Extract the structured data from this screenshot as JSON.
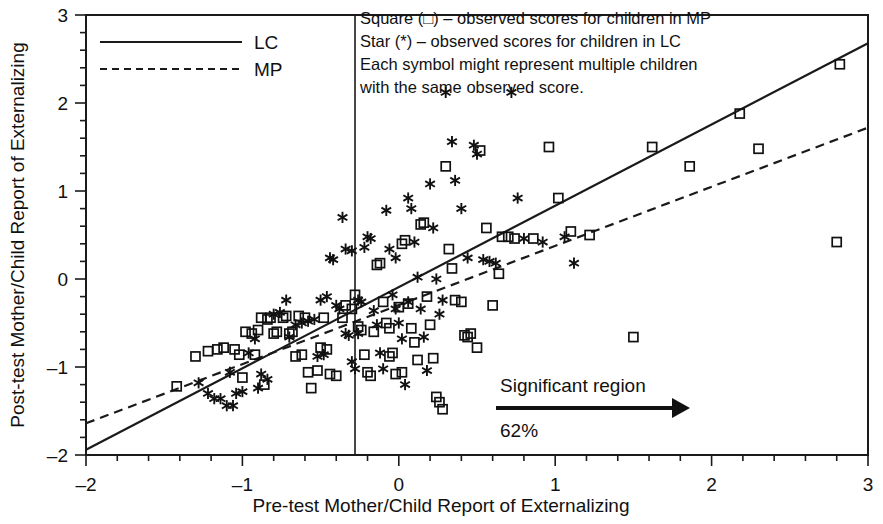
{
  "chart_data": {
    "type": "scatter",
    "title": "",
    "xlabel": "Pre-test Mother/Child Report of Externalizing",
    "ylabel": "Post-test Mother/Child Report of Externalizing",
    "xlim": [
      -2,
      3
    ],
    "ylim": [
      -2,
      3
    ],
    "xticks": [
      -2,
      -1,
      0,
      1,
      2,
      3
    ],
    "xtick_labels": [
      "-2",
      "-1",
      "0",
      "1",
      "2",
      "3"
    ],
    "yticks": [
      -2,
      -1,
      0,
      1,
      2,
      3
    ],
    "ytick_labels": [
      "-2",
      "-1",
      "0",
      "1",
      "2",
      "3"
    ],
    "minor_tick_step": 0.2,
    "grid": false,
    "legend_position": "top-left",
    "legend": [
      {
        "label": "LC",
        "style": "solid",
        "marker": "star"
      },
      {
        "label": "MP",
        "style": "dashed",
        "marker": "square"
      }
    ],
    "annotations": {
      "note_lines": [
        "Square (□) – observed scores for children in MP",
        "Star (*) – observed scores for children in LC",
        "Each symbol might represent multiple children",
        "with the same observed score."
      ],
      "significant_region_label": "Significant region",
      "significant_region_percent": "62%",
      "vertical_reference_line_x": -0.28
    },
    "lines": [
      {
        "name": "LC",
        "style": "solid",
        "x": [
          -2,
          3
        ],
        "y": [
          -1.94,
          2.68
        ]
      },
      {
        "name": "MP",
        "style": "dashed",
        "x": [
          -2,
          3
        ],
        "y": [
          -1.64,
          1.72
        ]
      }
    ],
    "series": [
      {
        "name": "MP",
        "marker": "square",
        "points": [
          [
            -1.42,
            -1.22
          ],
          [
            -1.3,
            -0.88
          ],
          [
            -1.22,
            -0.82
          ],
          [
            -1.16,
            -0.8
          ],
          [
            -1.12,
            -0.78
          ],
          [
            -1.05,
            -0.8
          ],
          [
            -1.0,
            -1.12
          ],
          [
            -0.98,
            -0.6
          ],
          [
            -0.94,
            -0.62
          ],
          [
            -0.9,
            -0.58
          ],
          [
            -0.88,
            -0.44
          ],
          [
            -0.84,
            -0.46
          ],
          [
            -0.82,
            -0.44
          ],
          [
            -0.8,
            -0.62
          ],
          [
            -0.78,
            -0.6
          ],
          [
            -0.74,
            -0.44
          ],
          [
            -0.72,
            -0.42
          ],
          [
            -0.7,
            -0.62
          ],
          [
            -0.68,
            -0.6
          ],
          [
            -0.66,
            -0.88
          ],
          [
            -0.62,
            -0.86
          ],
          [
            -0.6,
            -0.44
          ],
          [
            -0.58,
            -1.06
          ],
          [
            -0.52,
            -1.04
          ],
          [
            -0.5,
            -0.78
          ],
          [
            -0.46,
            -0.8
          ],
          [
            -0.44,
            -1.08
          ],
          [
            -0.4,
            -1.1
          ],
          [
            -0.36,
            -0.44
          ],
          [
            -0.34,
            -0.3
          ],
          [
            -0.3,
            -0.34
          ],
          [
            -0.28,
            -0.18
          ],
          [
            -0.26,
            -0.54
          ],
          [
            -0.24,
            -0.58
          ],
          [
            -0.22,
            -0.86
          ],
          [
            -0.2,
            -1.06
          ],
          [
            -0.18,
            -1.1
          ],
          [
            -0.16,
            -0.6
          ],
          [
            -0.14,
            0.16
          ],
          [
            -0.12,
            0.18
          ],
          [
            -0.1,
            -0.26
          ],
          [
            -0.08,
            -0.5
          ],
          [
            -0.06,
            -0.56
          ],
          [
            -0.04,
            -0.84
          ],
          [
            -0.02,
            -1.08
          ],
          [
            0.0,
            -0.32
          ],
          [
            0.02,
            0.4
          ],
          [
            0.04,
            0.44
          ],
          [
            0.06,
            -0.28
          ],
          [
            0.08,
            -0.56
          ],
          [
            0.1,
            -0.72
          ],
          [
            0.12,
            -0.92
          ],
          [
            0.14,
            0.62
          ],
          [
            0.16,
            0.64
          ],
          [
            0.18,
            -0.2
          ],
          [
            0.2,
            -0.52
          ],
          [
            0.22,
            -0.9
          ],
          [
            0.24,
            -1.34
          ],
          [
            0.26,
            -1.4
          ],
          [
            0.28,
            -1.48
          ],
          [
            0.3,
            1.28
          ],
          [
            0.32,
            0.34
          ],
          [
            0.34,
            0.12
          ],
          [
            0.36,
            -0.24
          ],
          [
            0.4,
            -0.26
          ],
          [
            0.44,
            -0.66
          ],
          [
            0.52,
            1.46
          ],
          [
            0.56,
            0.58
          ],
          [
            0.6,
            -0.3
          ],
          [
            0.64,
            0.06
          ],
          [
            0.7,
            0.48
          ],
          [
            0.74,
            0.46
          ],
          [
            0.86,
            0.46
          ],
          [
            0.96,
            1.5
          ],
          [
            1.02,
            0.92
          ],
          [
            1.1,
            0.54
          ],
          [
            1.22,
            0.5
          ],
          [
            1.5,
            -0.66
          ],
          [
            1.62,
            1.5
          ],
          [
            1.86,
            1.28
          ],
          [
            2.18,
            1.88
          ],
          [
            2.3,
            1.48
          ],
          [
            2.8,
            0.42
          ],
          [
            2.82,
            2.44
          ],
          [
            -1.02,
            -0.86
          ],
          [
            -0.92,
            -0.86
          ],
          [
            -0.86,
            -1.2
          ],
          [
            -0.56,
            -1.24
          ],
          [
            0.42,
            -0.64
          ],
          [
            0.46,
            -0.62
          ],
          [
            0.5,
            -0.78
          ],
          [
            -0.48,
            -0.44
          ],
          [
            -0.64,
            -0.42
          ],
          [
            0.66,
            0.48
          ],
          [
            -0.06,
            -0.88
          ],
          [
            0.02,
            -1.06
          ]
        ]
      },
      {
        "name": "LC",
        "marker": "star",
        "points": [
          [
            -1.28,
            -1.18
          ],
          [
            -1.22,
            -1.3
          ],
          [
            -1.18,
            -1.36
          ],
          [
            -1.14,
            -1.36
          ],
          [
            -1.08,
            -1.06
          ],
          [
            -1.04,
            -1.3
          ],
          [
            -1.0,
            -1.28
          ],
          [
            -0.96,
            -0.84
          ],
          [
            -0.92,
            -0.68
          ],
          [
            -0.88,
            -1.08
          ],
          [
            -0.84,
            -1.14
          ],
          [
            -0.8,
            -0.4
          ],
          [
            -0.76,
            -0.38
          ],
          [
            -0.72,
            -0.24
          ],
          [
            -0.7,
            -0.66
          ],
          [
            -0.66,
            -0.52
          ],
          [
            -0.62,
            -0.5
          ],
          [
            -0.58,
            -0.48
          ],
          [
            -0.54,
            -0.46
          ],
          [
            -0.52,
            -0.88
          ],
          [
            -0.48,
            -0.86
          ],
          [
            -0.46,
            -0.2
          ],
          [
            -0.44,
            0.24
          ],
          [
            -0.42,
            0.22
          ],
          [
            -0.4,
            -0.3
          ],
          [
            -0.38,
            -0.34
          ],
          [
            -0.36,
            0.7
          ],
          [
            -0.34,
            -0.62
          ],
          [
            -0.32,
            -0.64
          ],
          [
            -0.3,
            -0.94
          ],
          [
            -0.28,
            -1.02
          ],
          [
            -0.26,
            -0.24
          ],
          [
            -0.24,
            -0.26
          ],
          [
            -0.22,
            0.36
          ],
          [
            -0.2,
            0.48
          ],
          [
            -0.18,
            0.46
          ],
          [
            -0.16,
            -0.36
          ],
          [
            -0.14,
            -0.52
          ],
          [
            -0.12,
            -0.84
          ],
          [
            -0.1,
            -1.02
          ],
          [
            -0.08,
            0.78
          ],
          [
            -0.06,
            0.34
          ],
          [
            -0.04,
            -0.18
          ],
          [
            -0.02,
            -0.34
          ],
          [
            0.0,
            -0.5
          ],
          [
            0.02,
            -0.68
          ],
          [
            0.04,
            -1.2
          ],
          [
            0.06,
            0.92
          ],
          [
            0.08,
            0.8
          ],
          [
            0.1,
            0.42
          ],
          [
            0.12,
            0.02
          ],
          [
            0.14,
            -0.34
          ],
          [
            0.16,
            -0.66
          ],
          [
            0.18,
            -1.04
          ],
          [
            0.2,
            1.08
          ],
          [
            0.22,
            0.58
          ],
          [
            0.24,
            0.0
          ],
          [
            0.26,
            -0.4
          ],
          [
            0.3,
            2.12
          ],
          [
            0.34,
            1.56
          ],
          [
            0.36,
            1.12
          ],
          [
            0.4,
            0.8
          ],
          [
            0.48,
            1.52
          ],
          [
            0.5,
            1.42
          ],
          [
            0.54,
            0.22
          ],
          [
            0.58,
            0.2
          ],
          [
            0.62,
            0.18
          ],
          [
            0.72,
            2.12
          ],
          [
            0.76,
            0.92
          ],
          [
            0.8,
            0.46
          ],
          [
            0.92,
            0.42
          ],
          [
            1.06,
            0.48
          ],
          [
            1.12,
            0.18
          ],
          [
            -1.1,
            -1.44
          ],
          [
            -1.06,
            -1.44
          ],
          [
            -0.9,
            -1.24
          ],
          [
            -0.34,
            0.34
          ],
          [
            -0.3,
            0.32
          ],
          [
            -0.5,
            -0.24
          ],
          [
            -0.26,
            -0.62
          ],
          [
            0.06,
            -0.26
          ],
          [
            0.44,
            0.24
          ],
          [
            -0.02,
            0.24
          ],
          [
            0.28,
            -0.24
          ]
        ]
      }
    ]
  }
}
